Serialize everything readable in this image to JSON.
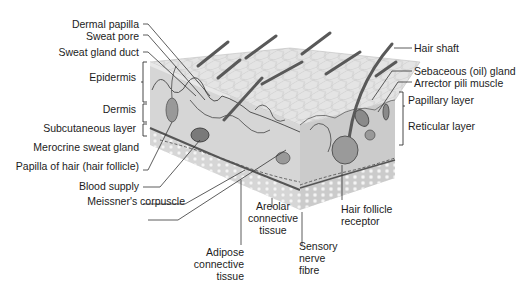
{
  "diagram": {
    "colors": {
      "skin_surface": "#e6e6e6",
      "front_face": "#d4d4d4",
      "side_face": "#c8c8c8",
      "subcutaneous": "#ececec",
      "hair": "#5a5a5a",
      "vessel": "#4a4a4a",
      "leader_line": "#333333"
    },
    "labels_left": [
      {
        "id": "dermal-papilla",
        "text": "Dermal papilla"
      },
      {
        "id": "sweat-pore",
        "text": "Sweat pore"
      },
      {
        "id": "sweat-gland-duct",
        "text": "Sweat gland duct"
      },
      {
        "id": "epidermis",
        "text": "Epidermis"
      },
      {
        "id": "dermis",
        "text": "Dermis"
      },
      {
        "id": "subcutaneous-layer",
        "text": "Subcutaneous layer"
      },
      {
        "id": "merocrine-sweat-gland",
        "text": "Merocrine sweat gland"
      },
      {
        "id": "papilla-of-hair",
        "text": "Papilla of hair (hair follicle)"
      },
      {
        "id": "blood-supply",
        "text": "Blood supply"
      },
      {
        "id": "meissners-corpuscle",
        "text": "Meissner's corpuscle"
      }
    ],
    "labels_bottom": [
      {
        "id": "adipose-connective-tissue",
        "lines": [
          "Adipose",
          "connective",
          "tissue"
        ]
      },
      {
        "id": "areolar-connective-tissue",
        "lines": [
          "Areolar",
          "connective",
          "tissue"
        ]
      },
      {
        "id": "sensory-nerve-fibre",
        "lines": [
          "Sensory",
          "nerve",
          "fibre"
        ]
      },
      {
        "id": "hair-follicle-receptor",
        "lines": [
          "Hair follicle",
          "receptor"
        ]
      }
    ],
    "labels_right": [
      {
        "id": "hair-shaft",
        "text": "Hair shaft"
      },
      {
        "id": "sebaceous-gland",
        "text": "Sebaceous (oil) gland"
      },
      {
        "id": "arrector-pili-muscle",
        "text": "Arrector pili muscle"
      },
      {
        "id": "papillary-layer",
        "text": "Papillary layer"
      },
      {
        "id": "reticular-layer",
        "text": "Reticular layer"
      }
    ]
  }
}
